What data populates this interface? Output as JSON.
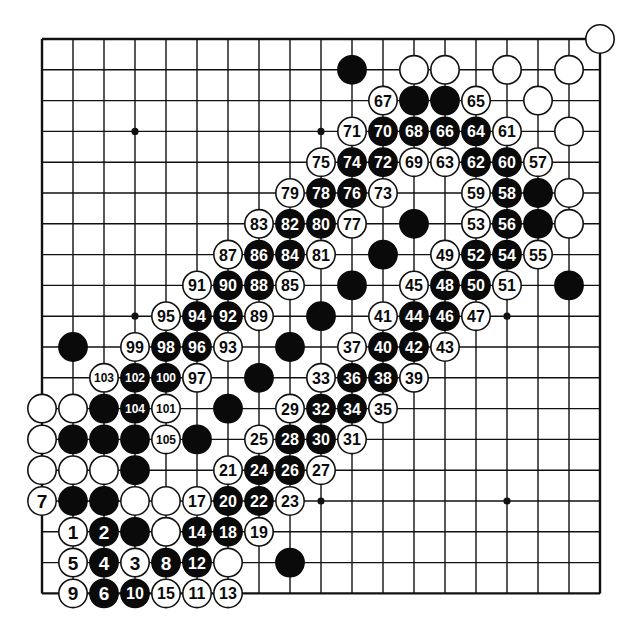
{
  "board": {
    "size": 19,
    "origin_x": 42,
    "origin_y": 39,
    "spacing_x": 31.0,
    "spacing_y": 30.8,
    "stone_radius": 14.2,
    "star_points": [
      [
        3,
        3
      ],
      [
        9,
        3
      ],
      [
        3,
        9
      ],
      [
        15,
        9
      ],
      [
        9,
        15
      ],
      [
        15,
        15
      ]
    ],
    "colors": {
      "black": "#0a0a0a",
      "white": "#ffffff",
      "line": "#111111"
    }
  },
  "stones": [
    {
      "col": 18,
      "row": 0,
      "color": "W",
      "label": ""
    },
    {
      "col": 10,
      "row": 1,
      "color": "B",
      "label": ""
    },
    {
      "col": 12,
      "row": 1,
      "color": "W",
      "label": ""
    },
    {
      "col": 13,
      "row": 1,
      "color": "W",
      "label": ""
    },
    {
      "col": 15,
      "row": 1,
      "color": "W",
      "label": ""
    },
    {
      "col": 17,
      "row": 1,
      "color": "W",
      "label": ""
    },
    {
      "col": 11,
      "row": 2,
      "color": "W",
      "label": "67"
    },
    {
      "col": 12,
      "row": 2,
      "color": "B",
      "label": ""
    },
    {
      "col": 13,
      "row": 2,
      "color": "B",
      "label": ""
    },
    {
      "col": 14,
      "row": 2,
      "color": "W",
      "label": "65"
    },
    {
      "col": 16,
      "row": 2,
      "color": "W",
      "label": ""
    },
    {
      "col": 10,
      "row": 3,
      "color": "W",
      "label": "71"
    },
    {
      "col": 11,
      "row": 3,
      "color": "B",
      "label": "70"
    },
    {
      "col": 12,
      "row": 3,
      "color": "B",
      "label": "68"
    },
    {
      "col": 13,
      "row": 3,
      "color": "B",
      "label": "66"
    },
    {
      "col": 14,
      "row": 3,
      "color": "B",
      "label": "64"
    },
    {
      "col": 15,
      "row": 3,
      "color": "W",
      "label": "61"
    },
    {
      "col": 17,
      "row": 3,
      "color": "W",
      "label": ""
    },
    {
      "col": 9,
      "row": 4,
      "color": "W",
      "label": "75"
    },
    {
      "col": 10,
      "row": 4,
      "color": "B",
      "label": "74"
    },
    {
      "col": 11,
      "row": 4,
      "color": "B",
      "label": "72"
    },
    {
      "col": 12,
      "row": 4,
      "color": "W",
      "label": "69"
    },
    {
      "col": 13,
      "row": 4,
      "color": "W",
      "label": "63"
    },
    {
      "col": 14,
      "row": 4,
      "color": "B",
      "label": "62"
    },
    {
      "col": 15,
      "row": 4,
      "color": "B",
      "label": "60"
    },
    {
      "col": 16,
      "row": 4,
      "color": "W",
      "label": "57"
    },
    {
      "col": 8,
      "row": 5,
      "color": "W",
      "label": "79"
    },
    {
      "col": 9,
      "row": 5,
      "color": "B",
      "label": "78"
    },
    {
      "col": 10,
      "row": 5,
      "color": "B",
      "label": "76"
    },
    {
      "col": 11,
      "row": 5,
      "color": "W",
      "label": "73"
    },
    {
      "col": 14,
      "row": 5,
      "color": "W",
      "label": "59"
    },
    {
      "col": 15,
      "row": 5,
      "color": "B",
      "label": "58"
    },
    {
      "col": 16,
      "row": 5,
      "color": "B",
      "label": ""
    },
    {
      "col": 17,
      "row": 5,
      "color": "W",
      "label": ""
    },
    {
      "col": 7,
      "row": 6,
      "color": "W",
      "label": "83"
    },
    {
      "col": 8,
      "row": 6,
      "color": "B",
      "label": "82"
    },
    {
      "col": 9,
      "row": 6,
      "color": "B",
      "label": "80"
    },
    {
      "col": 10,
      "row": 6,
      "color": "W",
      "label": "77"
    },
    {
      "col": 12,
      "row": 6,
      "color": "B",
      "label": ""
    },
    {
      "col": 14,
      "row": 6,
      "color": "W",
      "label": "53"
    },
    {
      "col": 15,
      "row": 6,
      "color": "B",
      "label": "56"
    },
    {
      "col": 16,
      "row": 6,
      "color": "B",
      "label": ""
    },
    {
      "col": 17,
      "row": 6,
      "color": "W",
      "label": ""
    },
    {
      "col": 6,
      "row": 7,
      "color": "W",
      "label": "87"
    },
    {
      "col": 7,
      "row": 7,
      "color": "B",
      "label": "86"
    },
    {
      "col": 8,
      "row": 7,
      "color": "B",
      "label": "84"
    },
    {
      "col": 9,
      "row": 7,
      "color": "W",
      "label": "81"
    },
    {
      "col": 11,
      "row": 7,
      "color": "B",
      "label": ""
    },
    {
      "col": 13,
      "row": 7,
      "color": "W",
      "label": "49"
    },
    {
      "col": 14,
      "row": 7,
      "color": "B",
      "label": "52"
    },
    {
      "col": 15,
      "row": 7,
      "color": "B",
      "label": "54"
    },
    {
      "col": 16,
      "row": 7,
      "color": "W",
      "label": "55"
    },
    {
      "col": 5,
      "row": 8,
      "color": "W",
      "label": "91"
    },
    {
      "col": 6,
      "row": 8,
      "color": "B",
      "label": "90"
    },
    {
      "col": 7,
      "row": 8,
      "color": "B",
      "label": "88"
    },
    {
      "col": 8,
      "row": 8,
      "color": "W",
      "label": "85"
    },
    {
      "col": 10,
      "row": 8,
      "color": "B",
      "label": ""
    },
    {
      "col": 12,
      "row": 8,
      "color": "W",
      "label": "45"
    },
    {
      "col": 13,
      "row": 8,
      "color": "B",
      "label": "48"
    },
    {
      "col": 14,
      "row": 8,
      "color": "B",
      "label": "50"
    },
    {
      "col": 15,
      "row": 8,
      "color": "W",
      "label": "51"
    },
    {
      "col": 17,
      "row": 8,
      "color": "B",
      "label": ""
    },
    {
      "col": 4,
      "row": 9,
      "color": "W",
      "label": "95"
    },
    {
      "col": 5,
      "row": 9,
      "color": "B",
      "label": "94"
    },
    {
      "col": 6,
      "row": 9,
      "color": "B",
      "label": "92"
    },
    {
      "col": 7,
      "row": 9,
      "color": "W",
      "label": "89"
    },
    {
      "col": 9,
      "row": 9,
      "color": "B",
      "label": ""
    },
    {
      "col": 11,
      "row": 9,
      "color": "W",
      "label": "41"
    },
    {
      "col": 12,
      "row": 9,
      "color": "B",
      "label": "44"
    },
    {
      "col": 13,
      "row": 9,
      "color": "B",
      "label": "46"
    },
    {
      "col": 14,
      "row": 9,
      "color": "W",
      "label": "47"
    },
    {
      "col": 1,
      "row": 10,
      "color": "B",
      "label": ""
    },
    {
      "col": 3,
      "row": 10,
      "color": "W",
      "label": "99"
    },
    {
      "col": 4,
      "row": 10,
      "color": "B",
      "label": "98"
    },
    {
      "col": 5,
      "row": 10,
      "color": "B",
      "label": "96"
    },
    {
      "col": 6,
      "row": 10,
      "color": "W",
      "label": "93"
    },
    {
      "col": 8,
      "row": 10,
      "color": "B",
      "label": ""
    },
    {
      "col": 10,
      "row": 10,
      "color": "W",
      "label": "37"
    },
    {
      "col": 11,
      "row": 10,
      "color": "B",
      "label": "40"
    },
    {
      "col": 12,
      "row": 10,
      "color": "B",
      "label": "42"
    },
    {
      "col": 13,
      "row": 10,
      "color": "W",
      "label": "43"
    },
    {
      "col": 2,
      "row": 11,
      "color": "W",
      "label": "103"
    },
    {
      "col": 3,
      "row": 11,
      "color": "B",
      "label": "102"
    },
    {
      "col": 4,
      "row": 11,
      "color": "B",
      "label": "100"
    },
    {
      "col": 5,
      "row": 11,
      "color": "W",
      "label": "97"
    },
    {
      "col": 7,
      "row": 11,
      "color": "B",
      "label": ""
    },
    {
      "col": 9,
      "row": 11,
      "color": "W",
      "label": "33"
    },
    {
      "col": 10,
      "row": 11,
      "color": "B",
      "label": "36"
    },
    {
      "col": 11,
      "row": 11,
      "color": "B",
      "label": "38"
    },
    {
      "col": 12,
      "row": 11,
      "color": "W",
      "label": "39"
    },
    {
      "col": 0,
      "row": 12,
      "color": "W",
      "label": ""
    },
    {
      "col": 1,
      "row": 12,
      "color": "W",
      "label": ""
    },
    {
      "col": 2,
      "row": 12,
      "color": "B",
      "label": ""
    },
    {
      "col": 3,
      "row": 12,
      "color": "B",
      "label": "104"
    },
    {
      "col": 4,
      "row": 12,
      "color": "W",
      "label": "101"
    },
    {
      "col": 6,
      "row": 12,
      "color": "B",
      "label": ""
    },
    {
      "col": 8,
      "row": 12,
      "color": "W",
      "label": "29"
    },
    {
      "col": 9,
      "row": 12,
      "color": "B",
      "label": "32"
    },
    {
      "col": 10,
      "row": 12,
      "color": "B",
      "label": "34"
    },
    {
      "col": 11,
      "row": 12,
      "color": "W",
      "label": "35"
    },
    {
      "col": 0,
      "row": 13,
      "color": "W",
      "label": ""
    },
    {
      "col": 1,
      "row": 13,
      "color": "B",
      "label": ""
    },
    {
      "col": 2,
      "row": 13,
      "color": "B",
      "label": ""
    },
    {
      "col": 3,
      "row": 13,
      "color": "B",
      "label": ""
    },
    {
      "col": 4,
      "row": 13,
      "color": "W",
      "label": "105"
    },
    {
      "col": 5,
      "row": 13,
      "color": "B",
      "label": ""
    },
    {
      "col": 7,
      "row": 13,
      "color": "W",
      "label": "25"
    },
    {
      "col": 8,
      "row": 13,
      "color": "B",
      "label": "28"
    },
    {
      "col": 9,
      "row": 13,
      "color": "B",
      "label": "30"
    },
    {
      "col": 10,
      "row": 13,
      "color": "W",
      "label": "31"
    },
    {
      "col": 0,
      "row": 14,
      "color": "W",
      "label": ""
    },
    {
      "col": 1,
      "row": 14,
      "color": "W",
      "label": ""
    },
    {
      "col": 2,
      "row": 14,
      "color": "W",
      "label": ""
    },
    {
      "col": 3,
      "row": 14,
      "color": "B",
      "label": ""
    },
    {
      "col": 6,
      "row": 14,
      "color": "W",
      "label": "21"
    },
    {
      "col": 7,
      "row": 14,
      "color": "B",
      "label": "24"
    },
    {
      "col": 8,
      "row": 14,
      "color": "B",
      "label": "26"
    },
    {
      "col": 9,
      "row": 14,
      "color": "W",
      "label": "27"
    },
    {
      "col": 0,
      "row": 15,
      "color": "W",
      "label": "7"
    },
    {
      "col": 1,
      "row": 15,
      "color": "B",
      "label": ""
    },
    {
      "col": 2,
      "row": 15,
      "color": "B",
      "label": ""
    },
    {
      "col": 3,
      "row": 15,
      "color": "W",
      "label": ""
    },
    {
      "col": 4,
      "row": 15,
      "color": "W",
      "label": ""
    },
    {
      "col": 5,
      "row": 15,
      "color": "W",
      "label": "17"
    },
    {
      "col": 6,
      "row": 15,
      "color": "B",
      "label": "20"
    },
    {
      "col": 7,
      "row": 15,
      "color": "B",
      "label": "22"
    },
    {
      "col": 8,
      "row": 15,
      "color": "W",
      "label": "23"
    },
    {
      "col": 1,
      "row": 16,
      "color": "W",
      "label": "1"
    },
    {
      "col": 2,
      "row": 16,
      "color": "B",
      "label": "2"
    },
    {
      "col": 3,
      "row": 16,
      "color": "B",
      "label": ""
    },
    {
      "col": 4,
      "row": 16,
      "color": "W",
      "label": ""
    },
    {
      "col": 5,
      "row": 16,
      "color": "B",
      "label": "14"
    },
    {
      "col": 6,
      "row": 16,
      "color": "B",
      "label": "18"
    },
    {
      "col": 7,
      "row": 16,
      "color": "W",
      "label": "19"
    },
    {
      "col": 1,
      "row": 17,
      "color": "W",
      "label": "5"
    },
    {
      "col": 2,
      "row": 17,
      "color": "B",
      "label": "4"
    },
    {
      "col": 3,
      "row": 17,
      "color": "W",
      "label": "3"
    },
    {
      "col": 4,
      "row": 17,
      "color": "B",
      "label": "8"
    },
    {
      "col": 5,
      "row": 17,
      "color": "B",
      "label": "12"
    },
    {
      "col": 6,
      "row": 17,
      "color": "W",
      "label": ""
    },
    {
      "col": 8,
      "row": 17,
      "color": "B",
      "label": ""
    },
    {
      "col": 1,
      "row": 18,
      "color": "W",
      "label": "9"
    },
    {
      "col": 2,
      "row": 18,
      "color": "B",
      "label": "6"
    },
    {
      "col": 3,
      "row": 18,
      "color": "B",
      "label": "10"
    },
    {
      "col": 4,
      "row": 18,
      "color": "W",
      "label": "15"
    },
    {
      "col": 5,
      "row": 18,
      "color": "W",
      "label": "11"
    },
    {
      "col": 6,
      "row": 18,
      "color": "W",
      "label": "13"
    }
  ]
}
